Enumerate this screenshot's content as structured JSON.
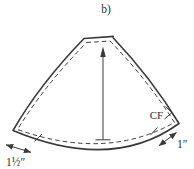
{
  "figure": {
    "label": "b)",
    "annotations": {
      "cf": "CF",
      "left_measurement": "1½″",
      "right_measurement": "1″"
    },
    "colors": {
      "line": "#3a3a3a",
      "text": "#2e2e2e",
      "background": "#ffffff"
    }
  }
}
